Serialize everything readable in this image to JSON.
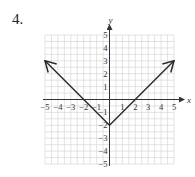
{
  "problem": {
    "number": "4."
  },
  "chart_data": {
    "type": "line",
    "title": "",
    "function": "y = |x| - 2",
    "xlabel": "x",
    "ylabel": "y",
    "xlim": [
      -5,
      5
    ],
    "ylim": [
      -5,
      5
    ],
    "grid": true,
    "x_ticks": [
      "-5",
      "-4",
      "-3",
      "-2",
      "-1",
      "1",
      "2",
      "3",
      "4",
      "5"
    ],
    "y_ticks": [
      "5",
      "4",
      "3",
      "2",
      "1",
      "-1",
      "-2",
      "-3",
      "-4",
      "-5"
    ],
    "series": [
      {
        "name": "y = |x| - 2",
        "x": [
          -5,
          0,
          5
        ],
        "y": [
          3,
          -2,
          3
        ],
        "arrows": "both-ends"
      }
    ],
    "key_points": {
      "vertex": [
        0,
        -2
      ],
      "x_intercepts": [
        [
          -2,
          0
        ],
        [
          2,
          0
        ]
      ]
    }
  },
  "colors": {
    "grid": "#d0d0d0",
    "axis": "#333333",
    "curve": "#2a2a2a",
    "text": "#333333"
  }
}
